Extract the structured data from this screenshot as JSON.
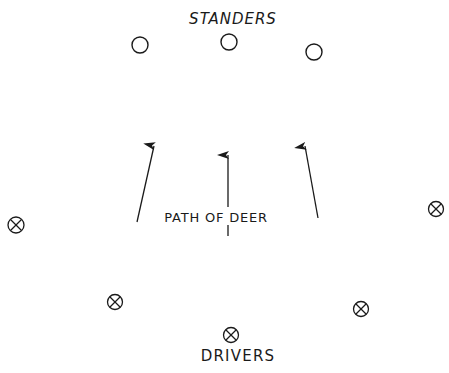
{
  "diagram": {
    "colors": {
      "ink": "#1a1a1a",
      "background": "#ffffff"
    },
    "labels": {
      "top": "STANDERS",
      "middle": "PATH OF DEER",
      "bottom": "DRIVERS"
    },
    "standers": [
      {
        "symbol": "open-circle",
        "x": 140,
        "y": 45
      },
      {
        "symbol": "open-circle",
        "x": 229,
        "y": 42
      },
      {
        "symbol": "open-circle",
        "x": 314,
        "y": 52
      }
    ],
    "drivers": [
      {
        "symbol": "circled-x",
        "x": 16,
        "y": 225
      },
      {
        "symbol": "circled-x",
        "x": 115,
        "y": 302
      },
      {
        "symbol": "circled-x",
        "x": 231,
        "y": 335
      },
      {
        "symbol": "circled-x",
        "x": 361,
        "y": 309
      },
      {
        "symbol": "circled-x",
        "x": 436,
        "y": 209
      }
    ],
    "paths": [
      {
        "from": [
          137,
          222
        ],
        "to": [
          155,
          142
        ]
      },
      {
        "from": [
          228,
          236
        ],
        "to": [
          228,
          151
        ]
      },
      {
        "from": [
          318,
          218
        ],
        "to": [
          304,
          142
        ]
      }
    ]
  }
}
